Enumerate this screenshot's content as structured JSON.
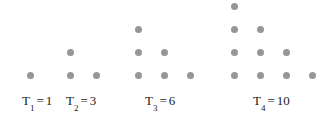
{
  "figure": {
    "width": 333,
    "height": 118,
    "background": "#ffffff",
    "dot_color": "#969696",
    "dot_diameter": 7,
    "text_color": "#1a1a1a",
    "column_spacing": 26,
    "row_spacing": 23,
    "baseline_y": 75
  },
  "chart_data": {
    "type": "scatter",
    "xlabel": "",
    "ylabel": "",
    "grid": false,
    "legend": "none",
    "series": [
      {
        "name": "T1",
        "term_index": 1,
        "value": 1,
        "rows": [
          1
        ],
        "points": [
          [
            30,
            75
          ]
        ]
      },
      {
        "name": "T2",
        "term_index": 2,
        "value": 3,
        "rows": [
          1,
          2
        ],
        "points": [
          [
            70,
            52
          ],
          [
            70,
            75
          ],
          [
            96,
            75
          ]
        ]
      },
      {
        "name": "T3",
        "term_index": 3,
        "value": 6,
        "rows": [
          1,
          2,
          3
        ],
        "points": [
          [
            138,
            29
          ],
          [
            138,
            52
          ],
          [
            164,
            52
          ],
          [
            138,
            75
          ],
          [
            164,
            75
          ],
          [
            190,
            75
          ]
        ]
      },
      {
        "name": "T4",
        "term_index": 4,
        "value": 10,
        "rows": [
          1,
          2,
          3,
          4
        ],
        "points": [
          [
            234,
            6
          ],
          [
            234,
            29
          ],
          [
            260,
            29
          ],
          [
            234,
            52
          ],
          [
            260,
            52
          ],
          [
            286,
            52
          ],
          [
            234,
            75
          ],
          [
            260,
            75
          ],
          [
            286,
            75
          ],
          [
            312,
            75
          ]
        ]
      }
    ]
  },
  "labels": [
    {
      "id": "t1",
      "symbol": "T",
      "subscript": "1",
      "equals": "=",
      "value": "1",
      "text": "T1 = 1",
      "x": 22,
      "y": 94
    },
    {
      "id": "t2",
      "symbol": "T",
      "subscript": "2",
      "equals": "=",
      "value": "3",
      "text": "T2 = 3",
      "x": 66,
      "y": 94
    },
    {
      "id": "t3",
      "symbol": "T",
      "subscript": "3",
      "equals": "=",
      "value": "6",
      "text": "T3 = 6",
      "x": 145,
      "y": 94
    },
    {
      "id": "t4",
      "symbol": "T",
      "subscript": "4",
      "equals": "=",
      "value": "10",
      "text": "T4 = 10",
      "x": 253,
      "y": 94
    }
  ]
}
